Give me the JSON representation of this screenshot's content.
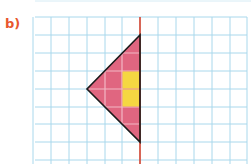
{
  "label": "b)",
  "colors": {
    "label": "#e8572e",
    "grid": "#a9d8ec",
    "axis": "#d9442f",
    "fill": "#e06680",
    "highlight": "#f5d742",
    "outline": "#1a1a1a",
    "innerGrid": "#f2b8c4"
  },
  "grid": {
    "cell": 18,
    "x_lines": [
      33,
      51,
      69,
      87,
      105,
      122,
      140,
      158,
      176,
      194,
      212,
      230,
      247
    ],
    "y_lines": [
      17,
      35,
      53,
      71,
      89,
      107,
      124,
      142,
      160
    ],
    "left": 35,
    "right": 247,
    "top": 17,
    "bottom": 164
  },
  "axis_of_symmetry": {
    "x": 140,
    "y1": 17,
    "y2": 164,
    "orientation": "vertical"
  },
  "shape": {
    "type": "triangle",
    "vertices": [
      [
        140,
        35
      ],
      [
        87,
        89
      ],
      [
        140,
        142
      ]
    ],
    "highlighted_cells": [
      {
        "x": 122,
        "y": 71,
        "w": 18,
        "h": 18
      },
      {
        "x": 122,
        "y": 89,
        "w": 18,
        "h": 18
      }
    ]
  }
}
